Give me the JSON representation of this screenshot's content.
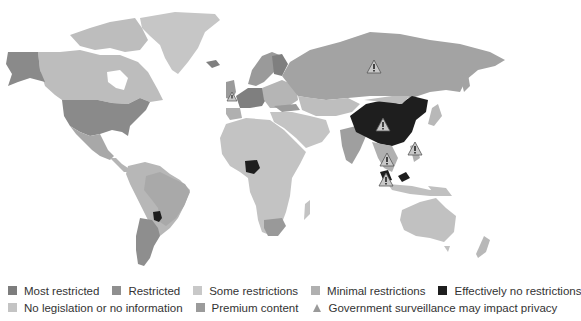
{
  "legend": {
    "row1": [
      {
        "label": "Most restricted",
        "color": "#7d7d7d"
      },
      {
        "label": "Restricted",
        "color": "#8f8f8f"
      },
      {
        "label": "Some restrictions",
        "color": "#c8c8c8"
      },
      {
        "label": "Minimal restrictions",
        "color": "#b0b0b0"
      },
      {
        "label": "Effectively no restrictions",
        "color": "#1e1e1e"
      }
    ],
    "row2": [
      {
        "label": "No legislation or no information",
        "color": "#c4c4c4"
      },
      {
        "label": "Premium content",
        "color": "#9b9b9b"
      },
      {
        "label": "Government surveillance may impact privacy",
        "icon": "warning-triangle-icon"
      }
    ]
  },
  "map": {
    "colors": {
      "background": "#ffffff",
      "greenland": "#c6c6c6",
      "canada": "#bdbdbd",
      "usa": "#8a8a8a",
      "alaska": "#8a8a8a",
      "mexico": "#a8a8a8",
      "central_america": "#b5b5b5",
      "south_america": "#b7b7b7",
      "brazil": "#a9a9a9",
      "argentina": "#8e8e8e",
      "paraguay": "#1e1e1e",
      "europe_west": "#7f7f7f",
      "scandinavia": "#9a9a9a",
      "russia": "#a3a3a3",
      "central_asia": "#bebebe",
      "middle_east": "#c4c4c4",
      "africa": "#c3c3c3",
      "nigeria": "#1e1e1e",
      "south_africa": "#999999",
      "india": "#9f9f9f",
      "china": "#1e1e1e",
      "se_asia": "#b0b0b0",
      "japan": "#b8b8b8",
      "australia": "#c1c1c1",
      "nz": "#b8b8b8",
      "warning": "#9a9a9a"
    },
    "warning_markers": [
      {
        "region": "Russia",
        "x": 374,
        "y": 67
      },
      {
        "region": "China",
        "x": 383,
        "y": 125
      },
      {
        "region": "UK",
        "x": 232,
        "y": 97
      },
      {
        "region": "Philippines",
        "x": 415,
        "y": 149
      },
      {
        "region": "Thailand",
        "x": 387,
        "y": 160
      },
      {
        "region": "Malaysia",
        "x": 386,
        "y": 180
      }
    ]
  }
}
